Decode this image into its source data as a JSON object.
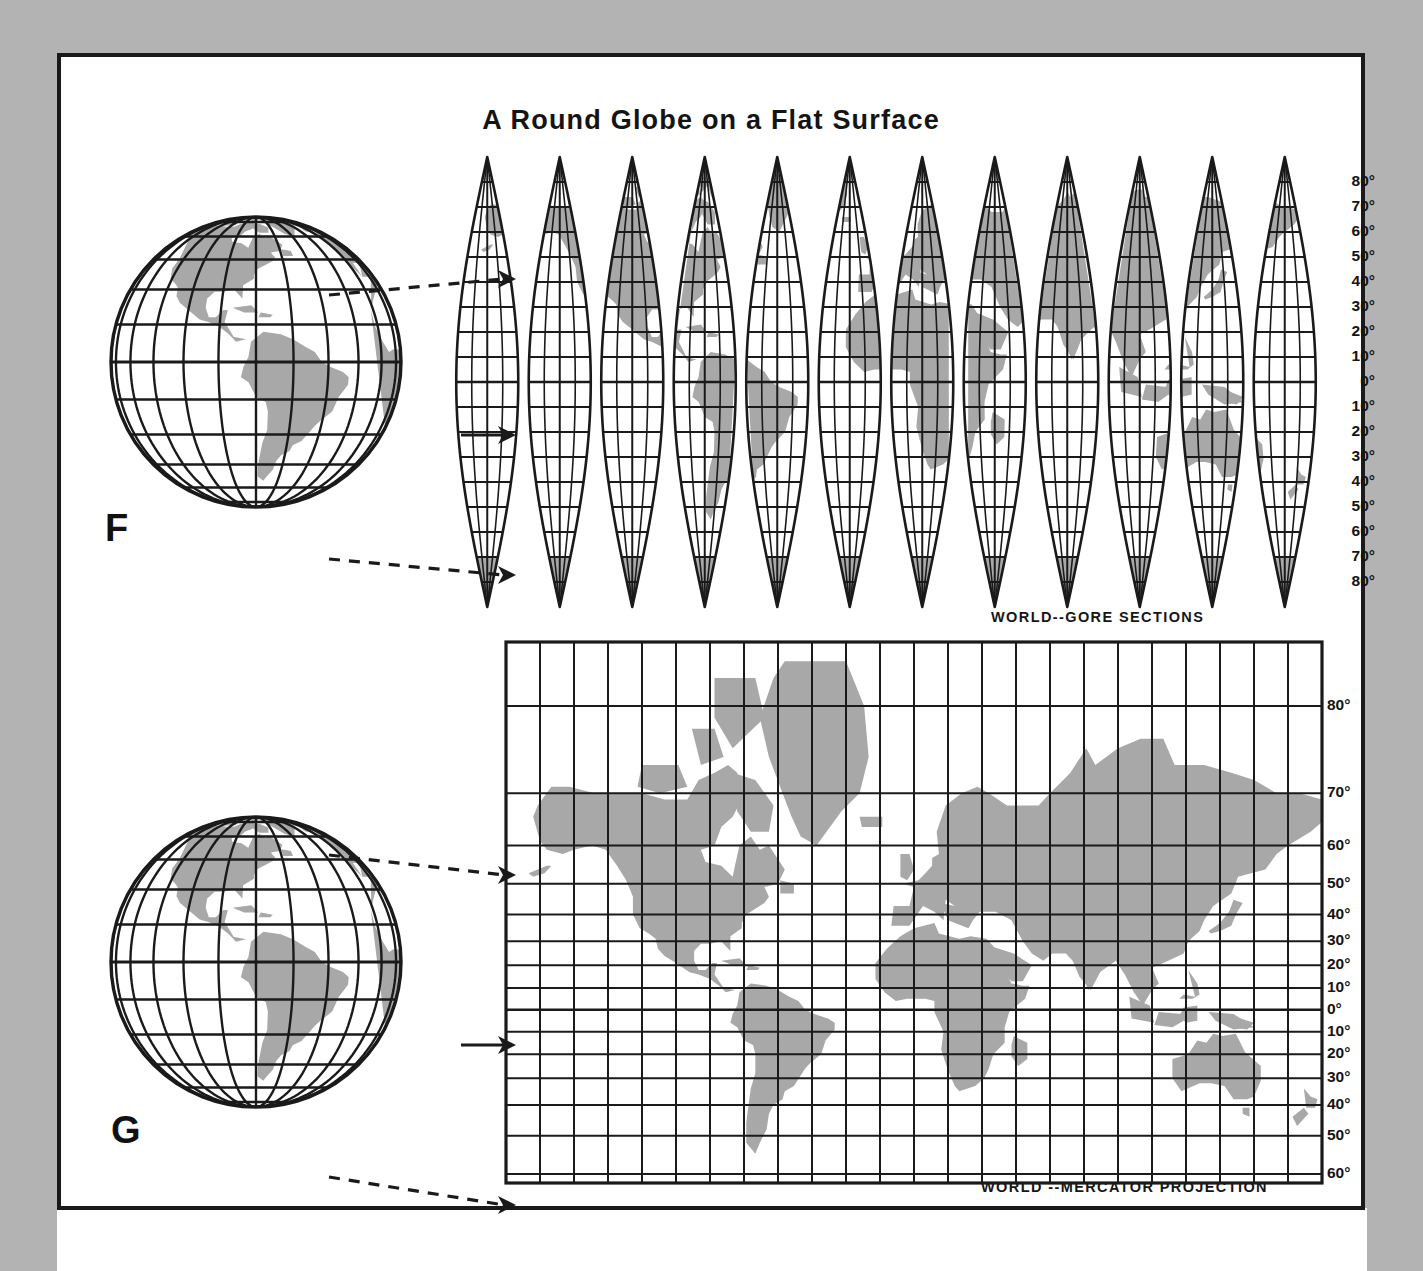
{
  "figure": {
    "title": "A Round Globe on a Flat Surface",
    "background_color": "#b3b3b3",
    "page_color": "#ffffff",
    "ink_color": "#1a1a1a",
    "land_color": "#a8a8a8"
  },
  "panels": [
    {
      "letter": "F",
      "globe_name": "globe-americas-top",
      "map_caption": "WORLD--GORE SECTIONS",
      "projection": "gore",
      "gore_count": 12,
      "lat_labels": [
        "80°",
        "70°",
        "60°",
        "50°",
        "40°",
        "30°",
        "20°",
        "10°",
        "0°",
        "10°",
        "20°",
        "30°",
        "40°",
        "50°",
        "60°",
        "70°",
        "80°"
      ],
      "lat_values": [
        80,
        70,
        60,
        50,
        40,
        30,
        20,
        10,
        0,
        -10,
        -20,
        -30,
        -40,
        -50,
        -60,
        -70,
        -80
      ],
      "arrows": [
        {
          "name": "arrow-north-gore",
          "style": "dashed"
        },
        {
          "name": "arrow-equator-gore",
          "style": "solid"
        },
        {
          "name": "arrow-south-gore",
          "style": "dashed"
        }
      ]
    },
    {
      "letter": "G",
      "globe_name": "globe-americas-bottom",
      "map_caption": "WORLD --MERCATOR PROJECTION",
      "projection": "mercator",
      "lat_labels": [
        "80°",
        "70°",
        "60°",
        "50°",
        "40°",
        "30°",
        "20°",
        "10°",
        "0°",
        "10°",
        "20°",
        "30°",
        "40°",
        "50°",
        "60°"
      ],
      "lat_values": [
        80,
        70,
        60,
        50,
        40,
        30,
        20,
        10,
        0,
        -10,
        -20,
        -30,
        -40,
        -50,
        -60
      ],
      "meridian_count": 24,
      "meridian_interval_deg": 15,
      "arrows": [
        {
          "name": "arrow-north-mercator",
          "style": "dashed"
        },
        {
          "name": "arrow-equator-mercator",
          "style": "solid"
        },
        {
          "name": "arrow-south-mercator",
          "style": "dashed"
        }
      ]
    }
  ],
  "globe": {
    "meridian_interval_deg": 15,
    "parallel_interval_deg": 15,
    "center_lon_deg": -75,
    "center_lat_deg": 0
  }
}
